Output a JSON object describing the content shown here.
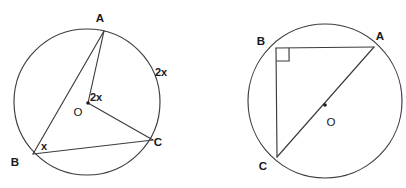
{
  "page": {
    "background_color": "#ffffff",
    "stroke_color": "#3b3b42",
    "text_color": "#18181b",
    "width": 406,
    "height": 188
  },
  "figures": [
    {
      "id": "left-figure",
      "name": "inscribed-angle-circle",
      "circle": {
        "cx": 87,
        "cy": 102,
        "r": 73
      },
      "center": {
        "cx": 88,
        "cy": 103
      },
      "points": {
        "A": {
          "x": 104,
          "y": 31
        },
        "B": {
          "x": 33,
          "y": 154
        },
        "C": {
          "x": 153,
          "y": 140
        },
        "O": {
          "x": 88,
          "y": 103
        }
      },
      "segments": [
        {
          "name": "chord-AB",
          "from": "A",
          "to": "B"
        },
        {
          "name": "radius-OA",
          "from": "A",
          "to": "O"
        },
        {
          "name": "radius-OC",
          "from": "O",
          "to": "C"
        },
        {
          "name": "chord-BC",
          "from": "B",
          "to": "C"
        }
      ],
      "labels": {
        "A": "A",
        "B": "B",
        "C": "C",
        "O": "O",
        "central_angle": "2x",
        "arc_measure": "2x",
        "inscribed_angle": "x"
      },
      "label_positions": {
        "A": {
          "x": 100,
          "y": 22
        },
        "B": {
          "x": 15,
          "y": 166
        },
        "C": {
          "x": 158,
          "y": 146
        },
        "O": {
          "x": 78,
          "y": 116
        },
        "central_angle": {
          "x": 96,
          "y": 101
        },
        "arc_measure": {
          "x": 161,
          "y": 76
        },
        "inscribed_angle": {
          "x": 44,
          "y": 150
        }
      }
    },
    {
      "id": "right-figure",
      "name": "thales-right-angle-circle",
      "circle": {
        "cx": 325,
        "cy": 101,
        "r": 77
      },
      "center": {
        "cx": 325,
        "cy": 105
      },
      "points": {
        "A": {
          "x": 374,
          "y": 47
        },
        "B": {
          "x": 276,
          "y": 48
        },
        "C": {
          "x": 277,
          "y": 157
        },
        "O": {
          "x": 325,
          "y": 105
        }
      },
      "segments": [
        {
          "name": "chord-BA",
          "from": "B",
          "to": "A"
        },
        {
          "name": "chord-BC",
          "from": "B",
          "to": "C"
        },
        {
          "name": "diameter-CA",
          "from": "C",
          "to": "A"
        }
      ],
      "right_angle_marker": {
        "vertex": "B",
        "size": 13
      },
      "labels": {
        "A": "A",
        "B": "B",
        "C": "C",
        "O": "O"
      },
      "label_positions": {
        "A": {
          "x": 380,
          "y": 40
        },
        "B": {
          "x": 261,
          "y": 45
        },
        "C": {
          "x": 263,
          "y": 170
        },
        "O": {
          "x": 331,
          "y": 126
        }
      }
    }
  ]
}
